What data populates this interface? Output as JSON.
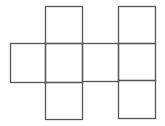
{
  "diagram": {
    "type": "cube-net",
    "background": "#ffffff",
    "stroke": "#555555",
    "stroke_width": 1.3,
    "squares": [
      {
        "id": "a-top",
        "x": 45,
        "y": 6,
        "w": 37,
        "h": 37
      },
      {
        "id": "left",
        "x": 10,
        "y": 43,
        "w": 35,
        "h": 39
      },
      {
        "id": "a-mid",
        "x": 45,
        "y": 43,
        "w": 37,
        "h": 39
      },
      {
        "id": "center",
        "x": 82,
        "y": 43,
        "w": 36,
        "h": 38
      },
      {
        "id": "a-bottom",
        "x": 45,
        "y": 82,
        "w": 37,
        "h": 37
      },
      {
        "id": "b-top",
        "x": 118,
        "y": 6,
        "w": 37,
        "h": 37
      },
      {
        "id": "b-mid",
        "x": 118,
        "y": 43,
        "w": 37,
        "h": 37
      },
      {
        "id": "b-bottom",
        "x": 118,
        "y": 80,
        "w": 37,
        "h": 38
      }
    ]
  }
}
